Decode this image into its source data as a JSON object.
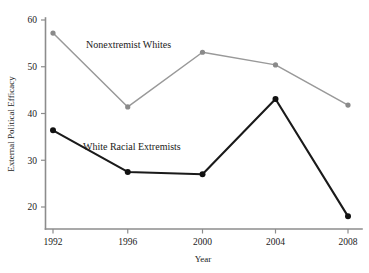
{
  "chart_data": {
    "type": "line",
    "title": "",
    "xlabel": "Year",
    "ylabel": "External Political Efficacy",
    "categories": [
      "1992",
      "1996",
      "2000",
      "2004",
      "2008"
    ],
    "x": [
      1992,
      1996,
      2000,
      2004,
      2008
    ],
    "xlim": [
      1990,
      2010
    ],
    "ylim": [
      16,
      61
    ],
    "yticks": [
      20,
      30,
      40,
      50,
      60
    ],
    "ytick_labels": [
      "20",
      "30",
      "40",
      "50",
      "60"
    ],
    "xticks": [
      1992,
      1996,
      2000,
      2004,
      2008
    ],
    "xtick_labels": [
      "1992",
      "1996",
      "2000",
      "2004",
      "2008"
    ],
    "grid": false,
    "legend": "inline-annotations",
    "series": [
      {
        "name": "Nonextremist Whites",
        "color": "#8a8a8a",
        "values": [
          57.2,
          41.4,
          53.1,
          50.4,
          41.8
        ]
      },
      {
        "name": "White Racial Extremists",
        "color": "#111111",
        "values": [
          36.4,
          27.5,
          27.0,
          43.1,
          18.0
        ]
      }
    ],
    "annotations": [
      {
        "text": "Nonextremist Whites",
        "x": 1994.6,
        "y": 55.5
      },
      {
        "text": "White Racial Extremists",
        "x": 1994.2,
        "y": 33.4
      }
    ]
  },
  "axes": {
    "y_title": "External Political Efficacy",
    "x_title": "Year"
  }
}
